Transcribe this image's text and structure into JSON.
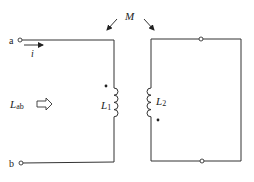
{
  "diagram": {
    "type": "coupled-inductor-circuit",
    "terminals": {
      "a": "a",
      "b": "b"
    },
    "current": {
      "label": "i",
      "direction": "right"
    },
    "input_inductance": {
      "symbol": "L",
      "subscript": "ab"
    },
    "mutual_inductance": {
      "label": "M"
    },
    "inductors": [
      {
        "symbol": "L",
        "subscript": "1",
        "dot_position": "top"
      },
      {
        "symbol": "L",
        "subscript": "2",
        "dot_position": "bottom"
      }
    ],
    "secondary_circuit": "short-circuited loop",
    "colors": {
      "line": "#333333",
      "background": "#ffffff"
    }
  }
}
